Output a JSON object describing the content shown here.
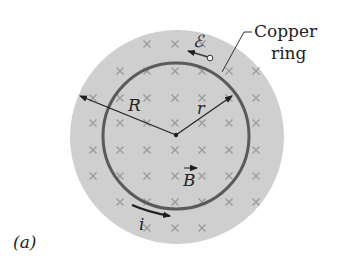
{
  "figure": {
    "panel_label": "(a)",
    "ring_label_line1": "Copper",
    "ring_label_line2": "ring",
    "emf_symbol": "ℰ",
    "radius_outer_label": "R",
    "radius_ring_label": "r",
    "field_label": "B",
    "current_label": "i"
  },
  "colors": {
    "field_region": "#cfcfcf",
    "ring": "#5a5a5a",
    "cross": "#9a9a9a",
    "ink": "#1e1e1e"
  }
}
